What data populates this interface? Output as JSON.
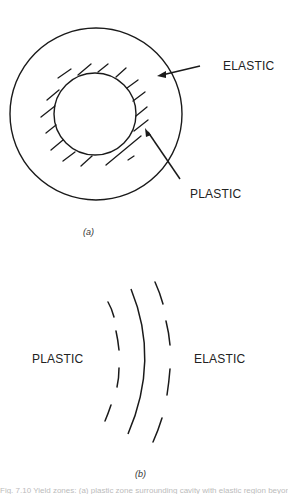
{
  "figure_a": {
    "label": "(a)",
    "elastic_label": "ELASTIC",
    "plastic_label": "PLASTIC",
    "outer_circle": {
      "cx": 96,
      "cy": 114,
      "r": 86
    },
    "inner_circle": {
      "cx": 95,
      "cy": 114,
      "r": 41
    }
  },
  "figure_b": {
    "label": "(b)",
    "plastic_label": "PLASTIC",
    "elastic_label": "ELASTIC"
  },
  "caption": {
    "text": "Fig. 7.10 Yield zones: (a) plastic zone surrounding cavity with elastic region beyond; (b) plastic–elastic boundary"
  },
  "colors": {
    "stroke": "#1a1a1a",
    "background": "#ffffff"
  }
}
